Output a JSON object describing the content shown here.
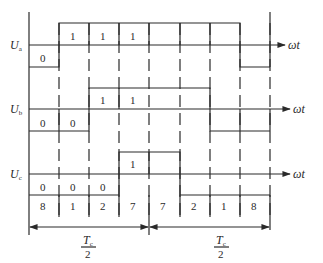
{
  "axis_label": "ωt",
  "signals": [
    {
      "name": "U",
      "sub": "a",
      "states": [
        0,
        1,
        1,
        1,
        1,
        1,
        1,
        0
      ]
    },
    {
      "name": "U",
      "sub": "b",
      "states": [
        0,
        0,
        1,
        1,
        1,
        1,
        0,
        0
      ]
    },
    {
      "name": "U",
      "sub": "c",
      "states": [
        0,
        0,
        0,
        1,
        1,
        0,
        0,
        0
      ]
    }
  ],
  "labels": {
    "ua": [
      "0",
      "1",
      "1",
      "1"
    ],
    "ub": [
      "0",
      "0",
      "1",
      "1"
    ],
    "uc": [
      "0",
      "0",
      "0",
      "1"
    ]
  },
  "sectors": [
    "8",
    "1",
    "2",
    "7",
    "7",
    "2",
    "1",
    "8"
  ],
  "period": {
    "numerator": "T",
    "sub": "c",
    "denominator": "2"
  }
}
